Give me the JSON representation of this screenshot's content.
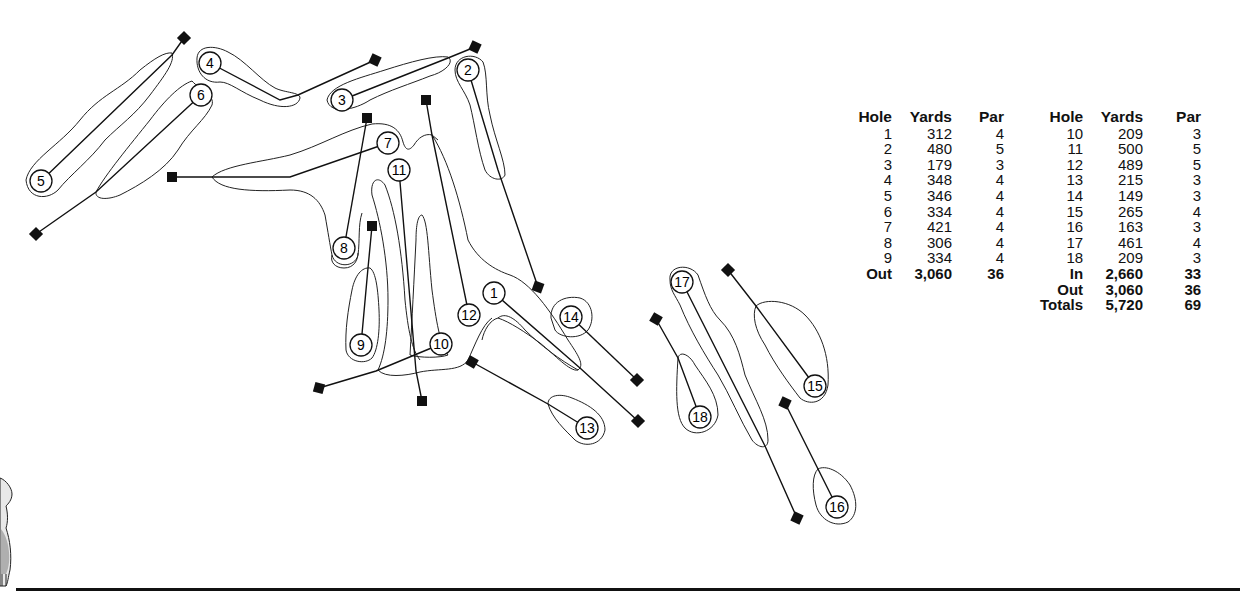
{
  "scorecard": {
    "headers": {
      "hole": "Hole",
      "yards": "Yards",
      "par": "Par"
    },
    "front_nine": [
      {
        "hole": "1",
        "yards": "312",
        "par": "4"
      },
      {
        "hole": "2",
        "yards": "480",
        "par": "5"
      },
      {
        "hole": "3",
        "yards": "179",
        "par": "3"
      },
      {
        "hole": "4",
        "yards": "348",
        "par": "4"
      },
      {
        "hole": "5",
        "yards": "346",
        "par": "4"
      },
      {
        "hole": "6",
        "yards": "334",
        "par": "4"
      },
      {
        "hole": "7",
        "yards": "421",
        "par": "4"
      },
      {
        "hole": "8",
        "yards": "306",
        "par": "4"
      },
      {
        "hole": "9",
        "yards": "334",
        "par": "4"
      }
    ],
    "front_total": {
      "label": "Out",
      "yards": "3,060",
      "par": "36"
    },
    "back_nine": [
      {
        "hole": "10",
        "yards": "209",
        "par": "3"
      },
      {
        "hole": "11",
        "yards": "500",
        "par": "5"
      },
      {
        "hole": "12",
        "yards": "489",
        "par": "5"
      },
      {
        "hole": "13",
        "yards": "215",
        "par": "3"
      },
      {
        "hole": "14",
        "yards": "149",
        "par": "3"
      },
      {
        "hole": "15",
        "yards": "265",
        "par": "4"
      },
      {
        "hole": "16",
        "yards": "163",
        "par": "3"
      },
      {
        "hole": "17",
        "yards": "461",
        "par": "4"
      },
      {
        "hole": "18",
        "yards": "209",
        "par": "3"
      }
    ],
    "back_totals": [
      {
        "label": "In",
        "yards": "2,660",
        "par": "33"
      },
      {
        "label": "Out",
        "yards": "3,060",
        "par": "36"
      },
      {
        "label": "Totals",
        "yards": "5,720",
        "par": "69"
      }
    ]
  },
  "map": {
    "holes": [
      {
        "number": "1",
        "label_pos": [
          494,
          293
        ],
        "tee": [
          638,
          421
        ],
        "path": [
          [
            494,
            293
          ],
          [
            580,
            368
          ],
          [
            638,
            421
          ]
        ]
      },
      {
        "number": "2",
        "label_pos": [
          468,
          70
        ],
        "tee": [
          538,
          287
        ],
        "path": [
          [
            468,
            70
          ],
          [
            498,
            170
          ],
          [
            538,
            287
          ]
        ]
      },
      {
        "number": "3",
        "label_pos": [
          342,
          100
        ],
        "tee": [
          475,
          47
        ],
        "path": [
          [
            342,
            100
          ],
          [
            448,
            58
          ],
          [
            475,
            47
          ]
        ]
      },
      {
        "number": "4",
        "label_pos": [
          210,
          63
        ],
        "tee": [
          375,
          60
        ],
        "path": [
          [
            210,
            63
          ],
          [
            280,
            100
          ],
          [
            298,
            95
          ],
          [
            375,
            60
          ]
        ]
      },
      {
        "number": "5",
        "label_pos": [
          41,
          181
        ],
        "tee": [
          184,
          38
        ],
        "path": [
          [
            41,
            181
          ],
          [
            172,
            55
          ],
          [
            184,
            38
          ]
        ]
      },
      {
        "number": "6",
        "label_pos": [
          201,
          95
        ],
        "tee": [
          36,
          234
        ],
        "path": [
          [
            201,
            95
          ],
          [
            96,
            192
          ],
          [
            36,
            234
          ]
        ]
      },
      {
        "number": "7",
        "label_pos": [
          388,
          143
        ],
        "tee": [
          172,
          177
        ],
        "path": [
          [
            388,
            143
          ],
          [
            290,
            177
          ],
          [
            212,
            177
          ],
          [
            172,
            177
          ]
        ]
      },
      {
        "number": "8",
        "label_pos": [
          344,
          248
        ],
        "tee": [
          367,
          118
        ],
        "path": [
          [
            344,
            248
          ],
          [
            367,
            118
          ]
        ]
      },
      {
        "number": "9",
        "label_pos": [
          361,
          345
        ],
        "tee": [
          372,
          226
        ],
        "path": [
          [
            361,
            345
          ],
          [
            368,
            268
          ],
          [
            372,
            226
          ]
        ]
      },
      {
        "number": "10",
        "label_pos": [
          441,
          344
        ],
        "tee": [
          319,
          388
        ],
        "path": [
          [
            441,
            344
          ],
          [
            376,
            371
          ],
          [
            319,
            388
          ]
        ]
      },
      {
        "number": "11",
        "label_pos": [
          399,
          170
        ],
        "tee": [
          422,
          401
        ],
        "path": [
          [
            399,
            170
          ],
          [
            416,
            371
          ],
          [
            422,
            401
          ]
        ]
      },
      {
        "number": "12",
        "label_pos": [
          469,
          315
        ],
        "tee": [
          426,
          100
        ],
        "path": [
          [
            469,
            315
          ],
          [
            432,
            135
          ],
          [
            426,
            100
          ]
        ]
      },
      {
        "number": "13",
        "label_pos": [
          587,
          428
        ],
        "tee": [
          472,
          362
        ],
        "path": [
          [
            472,
            362
          ],
          [
            548,
            404
          ],
          [
            587,
            428
          ]
        ]
      },
      {
        "number": "14",
        "label_pos": [
          571,
          317
        ],
        "tee": [
          637,
          380
        ],
        "path": [
          [
            571,
            317
          ],
          [
            637,
            380
          ]
        ]
      },
      {
        "number": "15",
        "label_pos": [
          815,
          386
        ],
        "tee": [
          728,
          270
        ],
        "path": [
          [
            728,
            270
          ],
          [
            756,
            306
          ],
          [
            815,
            386
          ]
        ]
      },
      {
        "number": "16",
        "label_pos": [
          837,
          507
        ],
        "tee": [
          785,
          403
        ],
        "path": [
          [
            785,
            403
          ],
          [
            818,
            469
          ],
          [
            837,
            507
          ]
        ]
      },
      {
        "number": "17",
        "label_pos": [
          682,
          282
        ],
        "tee": [
          797,
          518
        ],
        "path": [
          [
            682,
            282
          ],
          [
            765,
            446
          ],
          [
            797,
            518
          ]
        ]
      },
      {
        "number": "18",
        "label_pos": [
          700,
          417
        ],
        "tee": [
          656,
          319
        ],
        "path": [
          [
            656,
            319
          ],
          [
            678,
            358
          ],
          [
            700,
            417
          ]
        ]
      }
    ]
  },
  "decorations": {
    "golfer_figure": "golfer-illustration"
  }
}
